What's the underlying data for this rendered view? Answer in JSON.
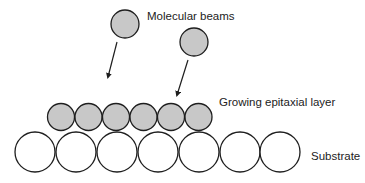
{
  "diagram": {
    "labels": {
      "beams": "Molecular beams",
      "epilayer": "Growing epitaxial layer",
      "substrate": "Substrate"
    },
    "colors": {
      "atom_fill": "#c8c8c8",
      "substrate_fill": "#ffffff",
      "stroke": "#1e1e1e",
      "text": "#222222"
    },
    "beam_atoms": [
      {
        "cx": 125,
        "cy": 24,
        "r": 14
      },
      {
        "cx": 194,
        "cy": 42,
        "r": 14
      }
    ],
    "arrows": [
      {
        "x1": 117,
        "y1": 42,
        "x2": 108,
        "y2": 77
      },
      {
        "x1": 188,
        "y1": 60,
        "x2": 177,
        "y2": 95
      }
    ],
    "epilayer_atoms": [
      {
        "cx": 61,
        "cy": 117,
        "r": 13.5
      },
      {
        "cx": 88.5,
        "cy": 117,
        "r": 13.5
      },
      {
        "cx": 116,
        "cy": 117,
        "r": 13.5
      },
      {
        "cx": 143.5,
        "cy": 117,
        "r": 13.5
      },
      {
        "cx": 171,
        "cy": 117,
        "r": 13.5
      },
      {
        "cx": 198.5,
        "cy": 117,
        "r": 13.5
      }
    ],
    "substrate_atoms": [
      {
        "cx": 35,
        "cy": 152,
        "r": 20
      },
      {
        "cx": 76,
        "cy": 152,
        "r": 20
      },
      {
        "cx": 117,
        "cy": 152,
        "r": 20
      },
      {
        "cx": 158,
        "cy": 152,
        "r": 20
      },
      {
        "cx": 199,
        "cy": 152,
        "r": 20
      },
      {
        "cx": 240,
        "cy": 152,
        "r": 20
      },
      {
        "cx": 280,
        "cy": 152,
        "r": 20
      }
    ],
    "label_positions": {
      "beams": {
        "x": 147,
        "y": 20
      },
      "epilayer": {
        "x": 219,
        "y": 106
      },
      "substrate": {
        "x": 311,
        "y": 160
      }
    }
  }
}
